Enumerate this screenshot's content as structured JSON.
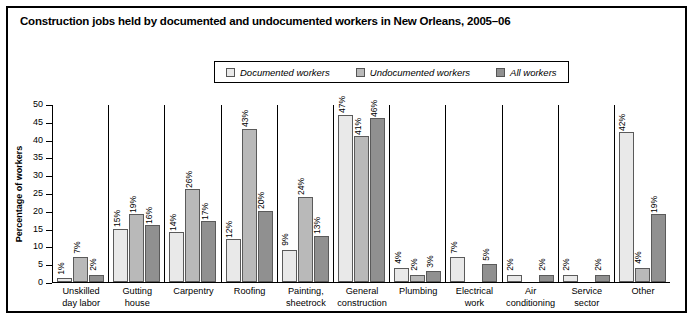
{
  "title": "Construction jobs held by documented and undocumented workers in New Orleans, 2005–06",
  "colors": {
    "documented": "#e9e9e9",
    "undocumented": "#b9b9b9",
    "all": "#909090",
    "axis": "#000000",
    "bar_outline": "#5a5a5a"
  },
  "legend": {
    "position": "top-center",
    "items": [
      {
        "label": "Documented workers",
        "swatch": "#e9e9e9",
        "icon": "legend-swatch-documented"
      },
      {
        "label": "Undocumented workers",
        "swatch": "#b9b9b9",
        "icon": "legend-swatch-undocumented"
      },
      {
        "label": "All workers",
        "swatch": "#909090",
        "icon": "legend-swatch-all"
      }
    ]
  },
  "chart_data": {
    "type": "bar",
    "title": "Construction jobs held by documented and undocumented workers in New Orleans, 2005–06",
    "xlabel": "",
    "ylabel": "Percentage of workers",
    "ylim": [
      0,
      50
    ],
    "yticks": [
      0,
      5,
      10,
      15,
      20,
      25,
      30,
      35,
      40,
      45,
      50
    ],
    "grid": false,
    "legend_position": "top-center",
    "categories": [
      "Unskilled day labor",
      "Gutting house",
      "Carpentry",
      "Roofing",
      "Painting, sheetrock",
      "General construction",
      "Plumbing",
      "Electrical work",
      "Air conditioning",
      "Service sector",
      "Other"
    ],
    "category_lines": [
      [
        "Unskilled",
        "day labor"
      ],
      [
        "Gutting",
        "house"
      ],
      [
        "Carpentry"
      ],
      [
        "Roofing"
      ],
      [
        "Painting,",
        "sheetrock"
      ],
      [
        "General",
        "construction"
      ],
      [
        "Plumbing"
      ],
      [
        "Electrical",
        "work"
      ],
      [
        "Air",
        "conditioning"
      ],
      [
        "Service",
        "sector"
      ],
      [
        "Other"
      ]
    ],
    "series": [
      {
        "name": "Documented workers",
        "color": "#e9e9e9",
        "values": [
          1,
          15,
          14,
          12,
          9,
          47,
          4,
          7,
          2,
          2,
          42
        ],
        "labels": [
          "1%",
          "15%",
          "14%",
          "12%",
          "9%",
          "47%",
          "4%",
          "7%",
          "2%",
          "2%",
          "42%"
        ]
      },
      {
        "name": "Undocumented workers",
        "color": "#b9b9b9",
        "values": [
          7,
          19,
          26,
          43,
          24,
          41,
          2,
          null,
          null,
          null,
          4
        ],
        "labels": [
          "7%",
          "19%",
          "26%",
          "43%",
          "24%",
          "41%",
          "2%",
          "",
          "",
          "",
          "4%"
        ]
      },
      {
        "name": "All workers",
        "color": "#909090",
        "values": [
          2,
          16,
          17,
          20,
          13,
          46,
          3,
          5,
          2,
          2,
          19
        ],
        "labels": [
          "2%",
          "16%",
          "17%",
          "20%",
          "13%",
          "46%",
          "3%",
          "5%",
          "2%",
          "2%",
          "19%"
        ]
      }
    ]
  }
}
